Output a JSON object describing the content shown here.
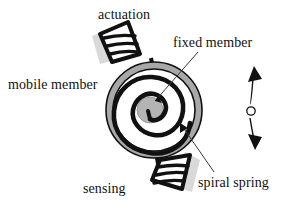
{
  "figure": {
    "background_color": "#ffffff",
    "width": 289,
    "height": 211,
    "labels": {
      "actuation": "actuation",
      "fixed_member": "fixed member",
      "mobile_member": "mobile member",
      "spiral_spring": "spiral spring",
      "sensing": "sensing"
    },
    "colors": {
      "ink": "#111111",
      "ring_fill": "#a8a8a8",
      "hub_fill": "#b4b4b4",
      "shadow": "#d9d9d9",
      "leader_line": "#3a3a3a",
      "white": "#ffffff"
    },
    "parts": {
      "outer_ring": "mobile-member-ring",
      "hub": "fixed-member-hub",
      "spiral": "spiral-spring-coil",
      "top_comb": "actuation-comb",
      "bottom_comb": "sensing-comb",
      "motion_indicator": "vertical double-headed arrow with center pivot circle"
    },
    "geometry": {
      "ring_center_x": 154,
      "ring_center_y": 110,
      "ring_outer_radius": 48,
      "ring_inner_radius": 41,
      "hub_radius": 13
    }
  }
}
